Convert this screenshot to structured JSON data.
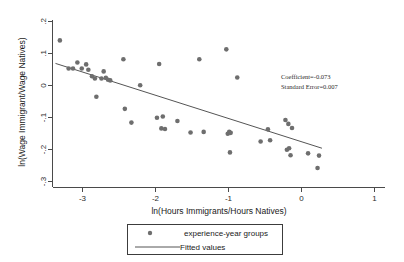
{
  "chart_data": {
    "type": "scatter",
    "title": "",
    "xlabel": "ln(Hours Immigrants/Hours Natives)",
    "ylabel": "ln(Wage Immigrant/Wage Natives)",
    "xlim": [
      -3.45,
      1.15
    ],
    "ylim": [
      -0.315,
      0.215
    ],
    "xticks": [
      -3,
      -2,
      -1,
      0,
      1
    ],
    "xticklabels": [
      "-3",
      "-2",
      "-1",
      "0",
      "1"
    ],
    "yticks": [
      0.2,
      0.1,
      0,
      -0.1,
      -0.2,
      -0.3
    ],
    "yticklabels": [
      ".2",
      ".1",
      "0",
      "-.1",
      "-.2",
      "-.3"
    ],
    "grid": false,
    "legend_position": "below-axes",
    "series": [
      {
        "name": "experience-year groups",
        "type": "scatter",
        "marker": "circle",
        "color": "#6e6e6e",
        "points": [
          [
            -3.31,
            0.141
          ],
          [
            -3.19,
            0.053
          ],
          [
            -3.13,
            0.053
          ],
          [
            -3.07,
            0.072
          ],
          [
            -3.01,
            0.053
          ],
          [
            -2.95,
            0.066
          ],
          [
            -2.92,
            0.049
          ],
          [
            -2.87,
            0.029
          ],
          [
            -2.83,
            0.022
          ],
          [
            -2.81,
            -0.035
          ],
          [
            -2.74,
            0.022
          ],
          [
            -2.71,
            0.044
          ],
          [
            -2.68,
            0.024
          ],
          [
            -2.65,
            0.018
          ],
          [
            -2.62,
            0.016
          ],
          [
            -2.44,
            0.082
          ],
          [
            -2.42,
            -0.073
          ],
          [
            -2.33,
            -0.116
          ],
          [
            -2.21,
            0.001
          ],
          [
            -1.98,
            -0.101
          ],
          [
            -1.95,
            0.067
          ],
          [
            -1.92,
            -0.134
          ],
          [
            -1.9,
            -0.097
          ],
          [
            -1.87,
            -0.136
          ],
          [
            -1.7,
            -0.111
          ],
          [
            -1.52,
            -0.147
          ],
          [
            -1.4,
            0.082
          ],
          [
            -1.34,
            -0.145
          ],
          [
            -1.03,
            0.113
          ],
          [
            -1.01,
            -0.151
          ],
          [
            -0.99,
            -0.145
          ],
          [
            -0.97,
            -0.148
          ],
          [
            -0.98,
            -0.209
          ],
          [
            -0.88,
            0.025
          ],
          [
            -0.56,
            -0.175
          ],
          [
            -0.46,
            -0.137
          ],
          [
            -0.43,
            -0.171
          ],
          [
            -0.22,
            -0.108
          ],
          [
            -0.2,
            -0.201
          ],
          [
            -0.18,
            -0.12
          ],
          [
            -0.17,
            -0.196
          ],
          [
            -0.15,
            -0.218
          ],
          [
            -0.13,
            -0.133
          ],
          [
            0.09,
            -0.212
          ],
          [
            0.24,
            -0.219
          ],
          [
            0.22,
            -0.258
          ]
        ]
      },
      {
        "name": "Fitted values",
        "type": "line",
        "color": "#555555",
        "endpoints": [
          [
            -3.37,
            0.069
          ],
          [
            0.28,
            -0.196
          ]
        ]
      }
    ],
    "annotations": [
      "Coefficient=-0.073",
      "Standard Error=0.007"
    ]
  },
  "legend": {
    "items": [
      {
        "label": "experience-year groups",
        "symbol": "marker"
      },
      {
        "label": "Fitted values",
        "symbol": "line"
      }
    ]
  },
  "annotation": {
    "coefficient_line": "Coefficient=-0.073",
    "std_error_line": "Standard Error=0.007"
  },
  "colors": {
    "marker": "#6e6e6e",
    "line": "#555555",
    "axis": "#4a4a4a",
    "text": "#1a1a1a",
    "background": "#ffffff"
  }
}
